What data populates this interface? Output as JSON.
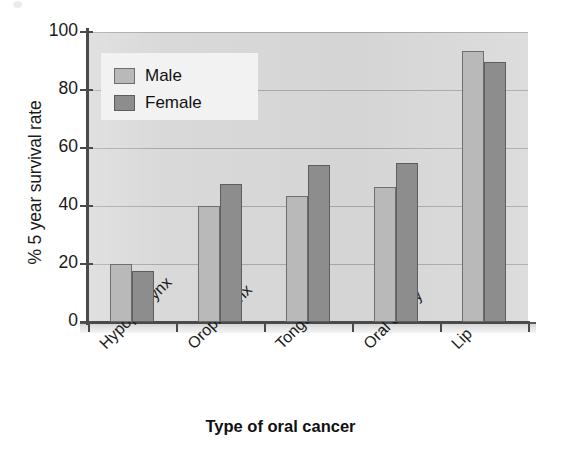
{
  "chart_data": {
    "type": "bar",
    "title": "",
    "xlabel": "Type of oral cancer",
    "ylabel": "% 5 year survival rate",
    "categories": [
      "Hypopharynx",
      "Oropharynx",
      "Tongue",
      "Oral cavity",
      "Lip"
    ],
    "series": [
      {
        "name": "Male",
        "color": "#b9b9b9",
        "values": [
          20,
          40,
          43.5,
          46.5,
          93.5
        ]
      },
      {
        "name": "Female",
        "color": "#8d8d8d",
        "values": [
          17.5,
          47.5,
          54,
          55,
          89.5
        ]
      }
    ],
    "ylim": [
      0,
      100
    ],
    "yticks": [
      0,
      20,
      40,
      60,
      80,
      100
    ],
    "ytick_labels": [
      "0",
      "20",
      "40",
      "60",
      "80",
      "100"
    ],
    "grid": true,
    "grid_axis": "y",
    "legend_position": "upper left",
    "xtick_label_rotation": -45,
    "plot_background": "#d9d9d9"
  },
  "legend": {
    "items": [
      {
        "label": "Male"
      },
      {
        "label": "Female"
      }
    ]
  },
  "axes": {
    "y_title": "% 5 year survival rate",
    "x_title": "Type of oral cancer"
  }
}
